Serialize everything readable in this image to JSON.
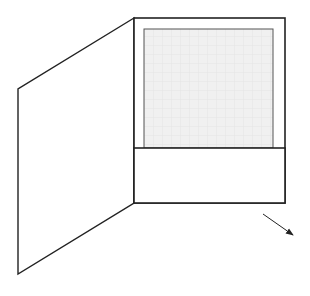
{
  "diagram": {
    "type": "line-drawing",
    "colors": {
      "background": "#ffffff",
      "stroke": "#222222",
      "inner_stroke": "#555555",
      "insert_fill": "#f0f0f0",
      "grid": "#e4e4e4"
    },
    "left_panel": {
      "points": [
        [
          134,
          18
        ],
        [
          18,
          89
        ],
        [
          18,
          274
        ],
        [
          134,
          203
        ]
      ]
    },
    "right_panel": {
      "x": 134,
      "y": 18,
      "width": 151,
      "height": 185
    },
    "insert_sheet": {
      "x": 144,
      "y": 29,
      "width": 129,
      "height": 119
    },
    "pocket": {
      "x": 134,
      "y": 148,
      "width": 151,
      "height": 55
    },
    "arrow": {
      "from": [
        263,
        214
      ],
      "to": [
        294,
        236
      ],
      "icon": "arrow-down-right-icon"
    }
  }
}
